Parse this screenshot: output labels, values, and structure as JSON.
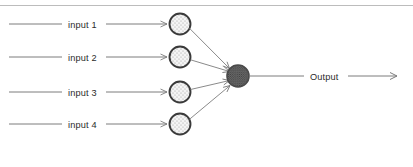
{
  "diagram": {
    "type": "neural-network-perceptron",
    "title": "",
    "background_color": "#ffffff",
    "top_rule": {
      "color": "#9a9a9a",
      "y": 5
    },
    "colors": {
      "line": "#7d7d7d",
      "input_node_stroke": "#3a3a3a",
      "input_node_fill": "#f2f2f2",
      "output_node_stroke": "#4a4a4a",
      "output_node_fill": "#5e5e5e",
      "text": "#2b2b2b",
      "stipple": "#8f8f8f"
    },
    "inputs": [
      {
        "label": "input 1",
        "line_y": 24,
        "label_x": 68,
        "node": {
          "cx": 180,
          "cy": 24,
          "r": 11
        }
      },
      {
        "label": "input 2",
        "line_y": 57,
        "label_x": 68,
        "node": {
          "cx": 180,
          "cy": 57,
          "r": 11
        }
      },
      {
        "label": "input 3",
        "line_y": 92,
        "label_x": 68,
        "node": {
          "cx": 180,
          "cy": 92,
          "r": 11
        }
      },
      {
        "label": "input 4",
        "line_y": 124,
        "label_x": 68,
        "node": {
          "cx": 180,
          "cy": 124,
          "r": 11
        }
      }
    ],
    "output": {
      "label": "Output",
      "label_x": 310,
      "node": {
        "cx": 238,
        "cy": 76,
        "r": 11
      },
      "line_y": 76,
      "line_start_x": 249,
      "line_end_x": 398
    },
    "geometry": {
      "input_line_start_x": 9,
      "input_line_label_gap_left": 64,
      "input_line_label_gap_right": 104,
      "input_arrow_end_x": 168
    }
  }
}
